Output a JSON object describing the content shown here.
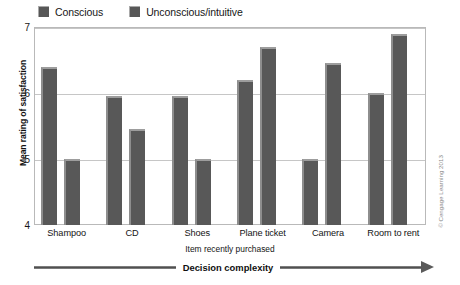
{
  "chart_data": {
    "type": "bar",
    "title": "",
    "categories": [
      "Shampoo",
      "CD",
      "Shoes",
      "Plane ticket",
      "Camera",
      "Room to rent"
    ],
    "series": [
      {
        "name": "Conscious",
        "values": [
          6.4,
          5.95,
          5.95,
          6.2,
          5.0,
          6.0
        ]
      },
      {
        "name": "Unconscious/intuitive",
        "values": [
          5.0,
          5.45,
          5.0,
          6.7,
          6.45,
          6.9
        ]
      }
    ],
    "xlabel": "Item recently purchased",
    "ylabel": "Mean rating of satisfaction",
    "ylim": [
      4,
      7
    ],
    "yticks": [
      4,
      5,
      6,
      7
    ],
    "ytick_labels": [
      "4",
      "5",
      "6",
      "7"
    ],
    "grid": true,
    "legend_position": "top-left",
    "bar_color": "#585858",
    "gridline_color": "#c6c6c6",
    "annotation": "Decision complexity",
    "credit": "© Cengage Learning 2013"
  }
}
